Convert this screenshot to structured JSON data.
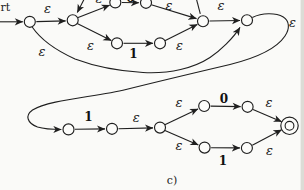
{
  "figure": {
    "start_label_partial": "rt",
    "caption": "c)"
  },
  "colors": {
    "ink": "#1f1f1f",
    "background": "#fafaf8",
    "page_edge": "#dcdcd6"
  },
  "diagram": {
    "type": "epsilon-nfa-state-diagram",
    "epsilon_symbol": "ε",
    "input_symbols": [
      "0",
      "1"
    ],
    "accepting_state_style": "double-circle",
    "labels": {
      "eps_s1_s2": "ε",
      "eps_s2_s3_clipped": "ε",
      "sym_s3_s4_clipped": "0",
      "eps_s4_s7": "ε",
      "eps_s2_s5": "ε",
      "sym_s5_s6": "1",
      "eps_s6_s7": "ε",
      "eps_s7_s8": "ε",
      "eps_skip_s1_s8": "ε",
      "eps_wrap_s8_s9": "ε",
      "sym_s9_s10": "1",
      "eps_s10_s11": "ε",
      "eps_s11_s12": "ε",
      "sym_s12_s13": "0",
      "eps_s13_accept": "ε",
      "eps_s11_s14": "ε",
      "sym_s14_s15": "1",
      "eps_s15_accept": "ε"
    }
  }
}
